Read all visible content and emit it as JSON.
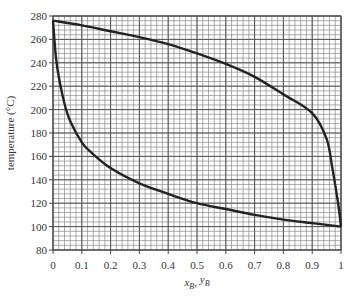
{
  "chart_data": {
    "type": "line",
    "title": "",
    "xlabel": "x_B, y_B",
    "ylabel": "temperature (°C)",
    "xlim": [
      0,
      1
    ],
    "ylim": [
      80,
      280
    ],
    "grid": true,
    "grid_major_x": 0.1,
    "grid_minor_x": 0.02,
    "grid_major_y": 20,
    "grid_minor_y": 4,
    "legend": "none",
    "x_ticks": [
      "0",
      "0.1",
      "0.2",
      "0.3",
      "0.4",
      "0.5",
      "0.6",
      "0.7",
      "0.8",
      "0.9",
      "1"
    ],
    "y_ticks": [
      "80",
      "100",
      "120",
      "140",
      "160",
      "180",
      "200",
      "220",
      "240",
      "260",
      "280"
    ],
    "series": [
      {
        "name": "dew-point curve (vapour, y_B)",
        "x": [
          0,
          0.1,
          0.2,
          0.3,
          0.4,
          0.5,
          0.6,
          0.7,
          0.8,
          0.9,
          0.95,
          0.97,
          0.99,
          1.0
        ],
        "y": [
          276,
          272,
          267,
          262,
          256,
          248,
          239,
          228,
          213,
          197,
          175,
          150,
          120,
          100
        ]
      },
      {
        "name": "bubble-point curve (liquid, x_B)",
        "x": [
          0,
          0.01,
          0.02,
          0.04,
          0.06,
          0.1,
          0.13,
          0.2,
          0.3,
          0.4,
          0.5,
          0.6,
          0.7,
          0.8,
          0.9,
          1.0
        ],
        "y": [
          276,
          245,
          228,
          205,
          190,
          172,
          164,
          150,
          137,
          128,
          120,
          115,
          110,
          106,
          103,
          100
        ]
      }
    ],
    "colors": {
      "curve": "#222222",
      "grid_major": "#555555",
      "grid_minor": "#8a8a8a",
      "text": "#333333"
    }
  }
}
